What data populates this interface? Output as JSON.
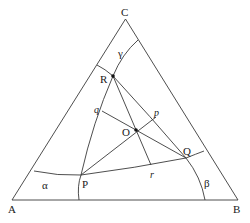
{
  "diagram": {
    "type": "ternary-phase-diagram",
    "vertices": [
      {
        "id": "A",
        "label": "A",
        "x": 12,
        "y": 200,
        "lx": 8,
        "ly": 213
      },
      {
        "id": "B",
        "label": "B",
        "x": 238,
        "y": 200,
        "lx": 233,
        "ly": 213
      },
      {
        "id": "C",
        "label": "C",
        "x": 125.5,
        "y": 19,
        "lx": 121,
        "ly": 16
      }
    ],
    "points": [
      {
        "id": "R",
        "label": "R",
        "x": 113,
        "y": 76,
        "lx": 100,
        "ly": 83,
        "dot": true
      },
      {
        "id": "O",
        "label": "O",
        "x": 136,
        "y": 130,
        "lx": 122,
        "ly": 136,
        "dot": true
      },
      {
        "id": "Q",
        "label": "Q",
        "x": 186,
        "y": 158,
        "lx": 183,
        "ly": 155,
        "dot": false
      },
      {
        "id": "P",
        "label": "P",
        "x": 81,
        "y": 175,
        "lx": 82,
        "ly": 188,
        "dot": false
      }
    ],
    "feet": [
      {
        "id": "q",
        "label": "q",
        "x": 102,
        "y": 111,
        "lx": 94,
        "ly": 113
      },
      {
        "id": "p",
        "label": "p",
        "x": 156,
        "y": 117,
        "lx": 154,
        "ly": 116
      },
      {
        "id": "r",
        "label": "r",
        "x": 151,
        "y": 165,
        "lx": 150,
        "ly": 178
      }
    ],
    "region_labels": [
      {
        "id": "alpha",
        "label": "α",
        "x": 42,
        "y": 189
      },
      {
        "id": "beta",
        "label": "β",
        "x": 204,
        "y": 187
      },
      {
        "id": "gamma",
        "label": "γ",
        "x": 118,
        "y": 57
      }
    ]
  }
}
